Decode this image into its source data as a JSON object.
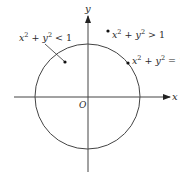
{
  "diagram": {
    "axes": {
      "x_label": "x",
      "y_label": "y",
      "origin_label": "O"
    },
    "circle": {
      "equation_label": "x² + y² = 1",
      "center": [
        87.5,
        96.5
      ],
      "radius": 52.5
    },
    "regions": [
      {
        "id": "inside",
        "label": "x² + y² < 1",
        "point": [
          65,
          62
        ]
      },
      {
        "id": "outside",
        "label": "x² + y² > 1",
        "point": [
          108,
          31
        ]
      },
      {
        "id": "on",
        "label": "x² + y² = 1",
        "point": [
          128,
          63
        ]
      }
    ],
    "labels": {
      "inside": {
        "base1": "x",
        "exp1": "2",
        "plus": " + ",
        "base2": "y",
        "exp2": "2",
        "rel": " < ",
        "rhs": "1"
      },
      "outside": {
        "base1": "x",
        "exp1": "2",
        "plus": " + ",
        "base2": "y",
        "exp2": "2",
        "rel": " > ",
        "rhs": "1"
      },
      "on": {
        "base1": "x",
        "exp1": "2",
        "plus": " + ",
        "base2": "y",
        "exp2": "2",
        "rel": " = ",
        "rhs": "1"
      }
    },
    "colors": {
      "stroke": "#333333",
      "text": "#2a2a2a",
      "background": "#ffffff"
    }
  }
}
